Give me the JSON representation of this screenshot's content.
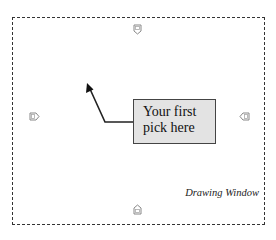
{
  "drawing_window": {
    "label": "Drawing Window",
    "border_style": "dashed",
    "border_color": "#333333",
    "background": "#ffffff"
  },
  "callout": {
    "line1": "Your first",
    "line2": "pick here",
    "fill_color": "#e3e3e3",
    "border_color": "#444444"
  },
  "pointer_arrow": {
    "color": "#222222",
    "tip": [
      87,
      83
    ],
    "bend": [
      105,
      122
    ],
    "end": [
      133,
      122
    ]
  },
  "markers": [
    {
      "position": "top",
      "icon": "pentagon-marker-down-icon"
    },
    {
      "position": "left",
      "icon": "pentagon-marker-right-icon"
    },
    {
      "position": "right",
      "icon": "pentagon-marker-left-icon"
    },
    {
      "position": "bottom",
      "icon": "pentagon-marker-up-icon"
    }
  ]
}
